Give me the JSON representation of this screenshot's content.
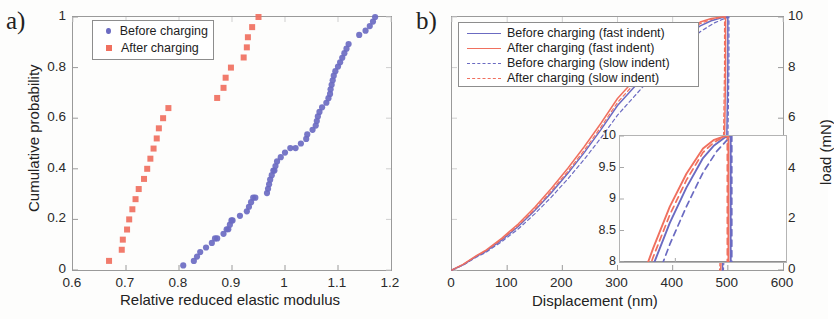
{
  "figure": {
    "panel_a_label": "a)",
    "panel_b_label": "b)"
  },
  "panel_a": {
    "xlabel": "Relative reduced elastic modulus",
    "ylabel": "Cumulative probability",
    "xticks": [
      "0.6",
      "0.7",
      "0.8",
      "0.9",
      "1",
      "1.1",
      "1.2"
    ],
    "yticks": [
      "0",
      "0.2",
      "0.4",
      "0.6",
      "0.8",
      "1"
    ],
    "legend": [
      {
        "label": "Before charging",
        "marker": "circle-marker",
        "color": "#6b6bc2"
      },
      {
        "label": "After charging",
        "marker": "square-marker",
        "color": "#f0705f"
      }
    ]
  },
  "panel_b": {
    "xlabel": "Displacement (nm)",
    "ylabel": "load (mN)",
    "xticks": [
      "0",
      "100",
      "200",
      "300",
      "400",
      "500",
      "600"
    ],
    "yticks": [
      "0",
      "2",
      "4",
      "6",
      "8",
      "10"
    ],
    "legend": [
      {
        "label": "Before charging (fast indent)",
        "style": "solid-line",
        "color": "#6b6bc2"
      },
      {
        "label": "After charging (fast indent)",
        "style": "solid-line",
        "color": "#f0705f"
      },
      {
        "label": "Before charging (slow indent)",
        "style": "dashed-line",
        "color": "#6b6bc2"
      },
      {
        "label": "After charging (slow indent)",
        "style": "dashed-line",
        "color": "#f0705f"
      }
    ],
    "inset": {
      "xticks": [
        "300",
        "400",
        "500",
        "600"
      ],
      "yticks": [
        "8",
        "8.5",
        "9",
        "9.5",
        "10"
      ]
    }
  },
  "chart_data": [
    {
      "type": "scatter",
      "panel": "a",
      "title": "",
      "xlabel": "Relative reduced elastic modulus",
      "ylabel": "Cumulative probability",
      "xlim": [
        0.6,
        1.2
      ],
      "ylim": [
        0.0,
        1.0
      ],
      "grid": false,
      "legend_position": "top-left",
      "series": [
        {
          "name": "Before charging",
          "marker": "circle",
          "color": "#6b6bc2",
          "points": [
            [
              0.808,
              0.018
            ],
            [
              0.828,
              0.036
            ],
            [
              0.834,
              0.053
            ],
            [
              0.84,
              0.071
            ],
            [
              0.851,
              0.089
            ],
            [
              0.862,
              0.107
            ],
            [
              0.868,
              0.125
            ],
            [
              0.872,
              0.125
            ],
            [
              0.884,
              0.143
            ],
            [
              0.89,
              0.161
            ],
            [
              0.893,
              0.161
            ],
            [
              0.896,
              0.179
            ],
            [
              0.899,
              0.196
            ],
            [
              0.901,
              0.196
            ],
            [
              0.915,
              0.214
            ],
            [
              0.928,
              0.232
            ],
            [
              0.932,
              0.25
            ],
            [
              0.936,
              0.268
            ],
            [
              0.94,
              0.286
            ],
            [
              0.944,
              0.286
            ],
            [
              0.966,
              0.304
            ],
            [
              0.968,
              0.321
            ],
            [
              0.97,
              0.339
            ],
            [
              0.972,
              0.357
            ],
            [
              0.975,
              0.375
            ],
            [
              0.978,
              0.393
            ],
            [
              0.98,
              0.393
            ],
            [
              0.982,
              0.411
            ],
            [
              0.985,
              0.429
            ],
            [
              0.992,
              0.446
            ],
            [
              1.0,
              0.464
            ],
            [
              1.01,
              0.482
            ],
            [
              1.02,
              0.482
            ],
            [
              1.03,
              0.5
            ],
            [
              1.04,
              0.518
            ],
            [
              1.042,
              0.536
            ],
            [
              1.052,
              0.554
            ],
            [
              1.058,
              0.571
            ],
            [
              1.06,
              0.589
            ],
            [
              1.062,
              0.607
            ],
            [
              1.065,
              0.625
            ],
            [
              1.07,
              0.643
            ],
            [
              1.078,
              0.661
            ],
            [
              1.082,
              0.679
            ],
            [
              1.085,
              0.696
            ],
            [
              1.086,
              0.714
            ],
            [
              1.088,
              0.732
            ],
            [
              1.09,
              0.75
            ],
            [
              1.092,
              0.768
            ],
            [
              1.095,
              0.786
            ],
            [
              1.1,
              0.804
            ],
            [
              1.104,
              0.821
            ],
            [
              1.108,
              0.839
            ],
            [
              1.112,
              0.857
            ],
            [
              1.116,
              0.875
            ],
            [
              1.12,
              0.893
            ],
            [
              1.14,
              0.929
            ],
            [
              1.152,
              0.946
            ],
            [
              1.16,
              0.964
            ],
            [
              1.166,
              0.982
            ],
            [
              1.17,
              1.0
            ]
          ]
        },
        {
          "name": "After charging",
          "marker": "square",
          "color": "#f0705f",
          "points": [
            [
              0.668,
              0.036
            ],
            [
              0.692,
              0.08
            ],
            [
              0.694,
              0.12
            ],
            [
              0.702,
              0.16
            ],
            [
              0.706,
              0.2
            ],
            [
              0.712,
              0.24
            ],
            [
              0.718,
              0.28
            ],
            [
              0.724,
              0.32
            ],
            [
              0.734,
              0.36
            ],
            [
              0.74,
              0.4
            ],
            [
              0.746,
              0.44
            ],
            [
              0.752,
              0.48
            ],
            [
              0.758,
              0.52
            ],
            [
              0.762,
              0.56
            ],
            [
              0.77,
              0.6
            ],
            [
              0.78,
              0.64
            ],
            [
              0.872,
              0.68
            ],
            [
              0.884,
              0.72
            ],
            [
              0.888,
              0.76
            ],
            [
              0.898,
              0.8
            ],
            [
              0.922,
              0.84
            ],
            [
              0.928,
              0.88
            ],
            [
              0.93,
              0.92
            ],
            [
              0.938,
              0.96
            ],
            [
              0.95,
              1.0
            ]
          ]
        }
      ]
    },
    {
      "type": "line",
      "panel": "b",
      "title": "",
      "xlabel": "Displacement (nm)",
      "ylabel": "load (mN)",
      "xlim": [
        0,
        600
      ],
      "ylim": [
        0,
        10
      ],
      "grid": false,
      "legend_position": "top-left",
      "series": [
        {
          "name": "Before charging (fast indent)",
          "style": "solid",
          "color": "#6b6bc2",
          "x": [
            0,
            20,
            45,
            60,
            90,
            120,
            150,
            180,
            210,
            240,
            270,
            300,
            330,
            360,
            390,
            420,
            450,
            470,
            490,
            500,
            500,
            498,
            495,
            492,
            490
          ],
          "y": [
            0,
            0.2,
            0.55,
            0.72,
            1.18,
            1.72,
            2.35,
            3.05,
            3.82,
            4.65,
            5.55,
            6.5,
            7.22,
            7.95,
            8.62,
            9.18,
            9.65,
            9.85,
            9.98,
            10.0,
            8.0,
            5.0,
            2.5,
            0.8,
            0
          ]
        },
        {
          "name": "After charging (fast indent)",
          "style": "solid",
          "color": "#f0705f",
          "x": [
            0,
            20,
            45,
            60,
            90,
            120,
            150,
            180,
            210,
            240,
            270,
            300,
            330,
            360,
            390,
            420,
            450,
            470,
            490,
            496,
            496,
            494,
            491,
            489,
            487
          ],
          "y": [
            0,
            0.22,
            0.58,
            0.76,
            1.25,
            1.82,
            2.48,
            3.22,
            4.02,
            4.88,
            5.8,
            6.78,
            7.5,
            8.22,
            8.88,
            9.4,
            9.8,
            9.94,
            10.0,
            10.0,
            8.0,
            5.0,
            2.5,
            0.8,
            0
          ]
        },
        {
          "name": "Before charging (slow indent)",
          "style": "dashed",
          "color": "#6b6bc2",
          "x": [
            0,
            20,
            45,
            60,
            90,
            120,
            150,
            180,
            210,
            240,
            270,
            300,
            330,
            360,
            390,
            420,
            450,
            475,
            495,
            502,
            502,
            500,
            497,
            494,
            492
          ],
          "y": [
            0,
            0.19,
            0.52,
            0.68,
            1.12,
            1.62,
            2.22,
            2.88,
            3.6,
            4.38,
            5.22,
            6.12,
            6.85,
            7.58,
            8.28,
            8.88,
            9.42,
            9.76,
            9.95,
            10.0,
            8.0,
            5.0,
            2.5,
            0.8,
            0
          ]
        },
        {
          "name": "After charging (slow indent)",
          "style": "dashed",
          "color": "#f0705f",
          "x": [
            0,
            20,
            45,
            60,
            90,
            120,
            150,
            180,
            210,
            240,
            270,
            300,
            330,
            360,
            390,
            420,
            450,
            470,
            488,
            494,
            494,
            492,
            489,
            487,
            485
          ],
          "y": [
            0,
            0.21,
            0.56,
            0.74,
            1.21,
            1.76,
            2.4,
            3.12,
            3.9,
            4.74,
            5.65,
            6.62,
            7.35,
            8.08,
            8.75,
            9.3,
            9.74,
            9.9,
            9.99,
            10.0,
            8.0,
            5.0,
            2.5,
            0.8,
            0
          ]
        }
      ],
      "inset": {
        "xlim": [
          300,
          600
        ],
        "ylim": [
          8,
          10
        ],
        "note": "zoom of peak and unloading region"
      }
    }
  ]
}
